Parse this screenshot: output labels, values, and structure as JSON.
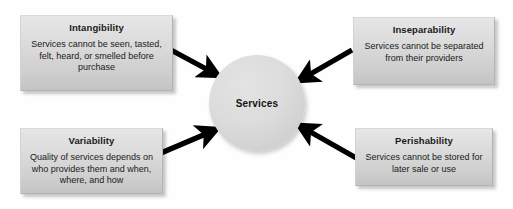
{
  "diagram": {
    "center": {
      "label": "Services",
      "shape": "circle",
      "fill": "#d8d8d8"
    },
    "boxes": [
      {
        "id": "intangibility",
        "title": "Intangibility",
        "description": "Services cannot be seen, tasted, felt, heard, or smelled before purchase",
        "position": "top-left",
        "fill": "#d8d8d8"
      },
      {
        "id": "inseparability",
        "title": "Inseparability",
        "description": "Services cannot be separated from their providers",
        "position": "top-right",
        "fill": "#d8d8d8"
      },
      {
        "id": "variability",
        "title": "Variability",
        "description": "Quality of services depends on who provides them and when, where, and how",
        "position": "bottom-left",
        "fill": "#d8d8d8"
      },
      {
        "id": "perishability",
        "title": "Perishability",
        "description": "Services cannot be stored for later sale or use",
        "position": "bottom-right",
        "fill": "#d8d8d8"
      }
    ],
    "arrows": [
      {
        "id": "arrow-intangibility-to-services",
        "from": "intangibility",
        "to": "center",
        "direction": "down-right",
        "color": "#000000"
      },
      {
        "id": "arrow-inseparability-to-services",
        "from": "inseparability",
        "to": "center",
        "direction": "down-left",
        "color": "#000000"
      },
      {
        "id": "arrow-variability-to-services",
        "from": "variability",
        "to": "center",
        "direction": "up-right",
        "color": "#000000"
      },
      {
        "id": "arrow-perishability-to-services",
        "from": "perishability",
        "to": "center",
        "direction": "up-left",
        "color": "#000000"
      }
    ]
  }
}
